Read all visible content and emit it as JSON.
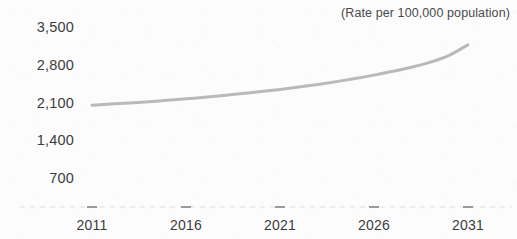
{
  "annotation": {
    "units_note": "(Rate per 100,000 population)"
  },
  "chart_data": {
    "type": "line",
    "title": "",
    "subtitle": "",
    "annotation": "(Rate per 100,000 population)",
    "xlabel": "",
    "ylabel": "",
    "xlim": [
      2011,
      2031
    ],
    "ylim": [
      0,
      3500
    ],
    "x_ticks": [
      2011,
      2016,
      2021,
      2026,
      2031
    ],
    "x_tick_labels": [
      "2011",
      "2016",
      "2021",
      "2026",
      "2031"
    ],
    "y_ticks": [
      700,
      1400,
      2100,
      2800,
      3500
    ],
    "y_tick_labels": [
      "700",
      "1,400",
      "2,100",
      "2,800",
      "3,500"
    ],
    "grid": false,
    "legend": null,
    "legend_position": "none",
    "line_color": "#b9b9b9",
    "line_width": 3,
    "x": [
      2011,
      2012,
      2013,
      2014,
      2015,
      2016,
      2017,
      2018,
      2019,
      2020,
      2021,
      2022,
      2023,
      2024,
      2025,
      2026,
      2027,
      2028,
      2029,
      2030,
      2031
    ],
    "series": [
      {
        "name": "Rate per 100,000 population",
        "values": [
          2050,
          2070,
          2092,
          2115,
          2140,
          2168,
          2198,
          2230,
          2265,
          2302,
          2342,
          2386,
          2434,
          2487,
          2545,
          2608,
          2678,
          2755,
          2848,
          2975,
          3170
        ]
      }
    ]
  }
}
